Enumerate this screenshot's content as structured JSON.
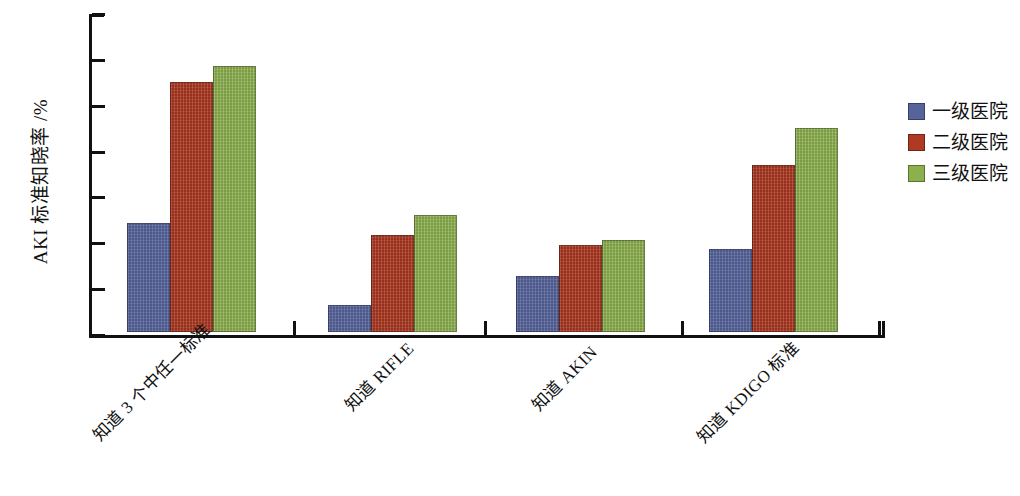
{
  "chart_data": {
    "type": "bar",
    "title": "",
    "xlabel": "",
    "ylabel": "AKI 标准知晓率 /%",
    "ylim": [
      0,
      70
    ],
    "ytick_step": 10,
    "yticks": [
      70,
      60,
      50,
      40,
      30,
      20,
      10,
      0
    ],
    "grid": false,
    "legend_position": "right",
    "categories": [
      "知道 3 个中任一标准",
      "知道 RIFLE",
      "知道 AKIN",
      "知道 KDIGO 标准"
    ],
    "series": [
      {
        "name": "一级医院",
        "color": "#56649b",
        "values": [
          23.7,
          6.0,
          12.2,
          18.0
        ]
      },
      {
        "name": "二级医院",
        "color": "#ae3a23",
        "values": [
          54.6,
          21.2,
          19.0,
          36.4
        ]
      },
      {
        "name": "三级医院",
        "color": "#8cb04e",
        "values": [
          58.0,
          25.6,
          20.1,
          44.4
        ]
      }
    ]
  },
  "axis": {
    "y_title": "AKI 标准知晓率 /%",
    "y_tick_labels": [
      "70",
      "60",
      "50",
      "40",
      "30",
      "20",
      "10",
      "0"
    ]
  },
  "legend": {
    "items": [
      {
        "label": "一级医院",
        "color": "#56649b"
      },
      {
        "label": "二级医院",
        "color": "#ae3a23"
      },
      {
        "label": "三级医院",
        "color": "#8cb04e"
      }
    ]
  }
}
